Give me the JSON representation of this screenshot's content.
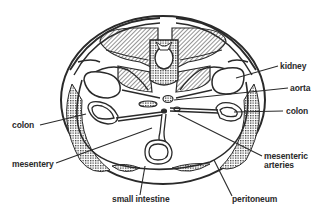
{
  "diagram": {
    "colors": {
      "ink": "#2a2a2a",
      "background": "#ffffff",
      "hatch": "#3a3a3a"
    },
    "labels": {
      "kidney": "kidney",
      "aorta": "aorta",
      "colon_right": "colon",
      "colon_left": "colon",
      "mesentery": "mesentery",
      "mesenteric_arteries_line1": "mesenteric",
      "mesenteric_arteries_line2": "arteries",
      "small_intestine": "small intestine",
      "peritoneum": "peritoneum"
    }
  }
}
